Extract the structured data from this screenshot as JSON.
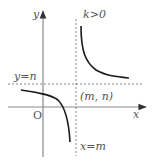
{
  "diagram": {
    "labels": {
      "y_axis": "y",
      "x_axis": "x",
      "origin": "O",
      "horizontal_asymptote": "y=n",
      "vertical_asymptote": "x=m",
      "center_point": "(m, n)",
      "condition": "k>0"
    },
    "colors": {
      "axis": "#8a8a8a",
      "curve": "#1a1a1a",
      "dashed": "#666666",
      "text": "#555555"
    }
  }
}
